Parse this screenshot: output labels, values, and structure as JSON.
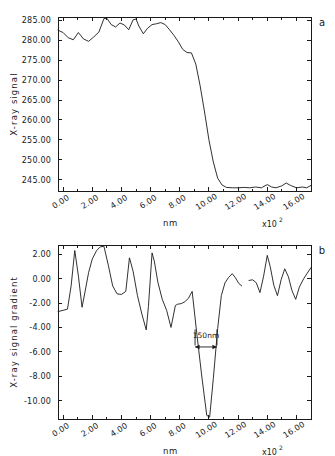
{
  "figure": {
    "background": "#ffffff",
    "line_color": "#1a1a1a"
  },
  "panels": [
    {
      "letter": "a",
      "chart_data": {
        "type": "line",
        "title": "",
        "xlabel": "nm",
        "ylabel": "X-ray signal",
        "x_exponent_base": "x10",
        "x_exponent_power": "2",
        "xlim": [
          -0.35,
          17.0
        ],
        "ylim": [
          242.2,
          285.8
        ],
        "xticks": [
          0,
          2,
          4,
          6,
          8,
          10,
          12,
          14,
          16
        ],
        "xticklabels": [
          "0.00",
          "2.00",
          "4.00",
          "6.00",
          "8.00",
          "10.00",
          "12.00",
          "14.00",
          "16.00"
        ],
        "xminorticks": [
          1,
          3,
          5,
          7,
          9,
          11,
          13,
          15
        ],
        "yticks": [
          245,
          250,
          255,
          260,
          265,
          270,
          275,
          280,
          285
        ],
        "yticklabels": [
          "245.00",
          "250.00",
          "255.00",
          "260.00",
          "265.00",
          "270.00",
          "275.00",
          "280.00",
          "285.00"
        ],
        "grid": false,
        "legend": false,
        "series": [
          {
            "name": "X-ray signal",
            "x": [
              -0.35,
              0.0,
              0.35,
              0.7,
              1.05,
              1.4,
              1.75,
              2.1,
              2.45,
              2.8,
              3.0,
              3.3,
              3.6,
              3.9,
              4.2,
              4.5,
              4.8,
              5.0,
              5.2,
              5.5,
              5.8,
              6.1,
              6.4,
              6.7,
              7.0,
              7.3,
              7.6,
              7.9,
              8.2,
              8.5,
              8.8,
              9.1,
              9.4,
              9.7,
              10.0,
              10.3,
              10.6,
              10.9,
              11.2,
              11.6,
              12.0,
              12.4,
              12.8,
              13.2,
              13.6,
              14.0,
              14.3,
              14.6,
              15.0,
              15.3,
              15.6,
              16.0,
              16.4,
              16.7,
              17.0
            ],
            "y": [
              282.5,
              281.9,
              280.6,
              280.1,
              281.9,
              280.3,
              279.7,
              280.8,
              282.0,
              285.4,
              285.5,
              283.9,
              283.3,
              284.3,
              283.8,
              282.6,
              285.1,
              285.3,
              283.5,
              281.6,
              283.0,
              283.9,
              284.1,
              284.4,
              283.9,
              282.6,
              281.2,
              279.6,
              277.7,
              276.9,
              276.8,
              274.0,
              268.5,
              262.0,
              255.0,
              249.5,
              245.4,
              243.7,
              243.1,
              243.0,
              243.0,
              243.1,
              243.0,
              243.2,
              243.0,
              243.8,
              243.2,
              243.0,
              243.5,
              244.2,
              243.6,
              243.0,
              243.2,
              243.0,
              243.6
            ]
          }
        ]
      }
    },
    {
      "letter": "b",
      "chart_data": {
        "type": "line",
        "title": "",
        "xlabel": "nm",
        "ylabel": "X-ray signal gradient",
        "x_exponent_base": "x10",
        "x_exponent_power": "2",
        "xlim": [
          -0.35,
          17.0
        ],
        "ylim": [
          -11.5,
          2.75
        ],
        "xticks": [
          0,
          2,
          4,
          6,
          8,
          10,
          12,
          14,
          16
        ],
        "xticklabels": [
          "0.00",
          "2.00",
          "4.00",
          "6.00",
          "8.00",
          "10.00",
          "12.00",
          "14.00",
          "16.00"
        ],
        "xminorticks": [
          1,
          3,
          5,
          7,
          9,
          11,
          13,
          15
        ],
        "yticks": [
          -10,
          -8,
          -6,
          -4,
          -2,
          0,
          2
        ],
        "yticklabels": [
          "-10.00",
          "-8.00",
          "-6.00",
          "-4.00",
          "-2.00",
          "0.00",
          "2.00"
        ],
        "grid": false,
        "legend": false,
        "annotations": [
          {
            "text": "150nm",
            "type": "double-arrow",
            "x_start": 9.05,
            "x_end": 10.55,
            "y": -5.6,
            "label_y": -4.9
          }
        ],
        "series": [
          {
            "name": "gradient-segment-1",
            "x": [
              -0.35,
              0.0,
              0.3,
              0.55,
              0.8,
              1.05,
              1.3,
              1.5,
              1.75,
              2.0,
              2.3,
              2.55,
              2.8,
              3.1,
              3.4,
              3.7,
              4.0,
              4.3,
              4.55,
              4.8,
              5.1,
              5.4,
              5.7,
              5.85,
              6.1,
              6.25,
              6.5,
              6.8,
              7.1,
              7.4,
              7.7,
              7.85,
              8.1,
              8.35,
              8.6,
              8.85,
              9.15,
              9.5,
              9.85,
              10.05,
              10.3,
              10.6,
              10.85,
              11.1,
              11.35,
              11.6,
              11.8,
              12.05,
              12.25
            ],
            "y": [
              -2.7,
              -2.6,
              -2.5,
              -0.6,
              2.3,
              0.2,
              -2.35,
              -1.1,
              0.5,
              1.6,
              2.3,
              2.6,
              2.65,
              1.1,
              -0.6,
              -1.25,
              -1.3,
              -1.05,
              1.7,
              0.6,
              -1.4,
              -2.9,
              -4.2,
              -2.3,
              2.1,
              1.45,
              -0.3,
              -1.7,
              -2.6,
              -4.0,
              -2.2,
              -2.1,
              -2.05,
              -1.9,
              -1.6,
              -1.05,
              -4.3,
              -7.9,
              -11.2,
              -11.35,
              -8.2,
              -4.1,
              -1.4,
              -0.35,
              0.1,
              0.4,
              0.1,
              -0.4,
              -0.6
            ]
          },
          {
            "name": "gradient-segment-2",
            "x": [
              12.75,
              13.0,
              13.25,
              13.5,
              13.75,
              14.0,
              14.2,
              14.45,
              14.7,
              14.95,
              15.2,
              15.45,
              15.7,
              15.95,
              16.2,
              16.5,
              16.75,
              17.0
            ],
            "y": [
              -0.15,
              -0.1,
              -0.35,
              -1.15,
              0.2,
              1.9,
              1.0,
              -0.55,
              -1.4,
              -0.1,
              0.8,
              0.15,
              -1.0,
              -1.7,
              -0.7,
              0.0,
              0.45,
              0.9
            ]
          }
        ]
      }
    }
  ]
}
